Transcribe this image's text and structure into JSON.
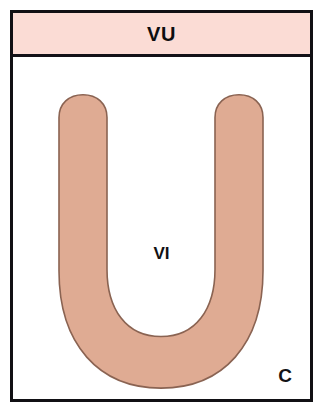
{
  "figure": {
    "panel_letter": "C",
    "frame_color": "#111014",
    "background_color": "#ffffff"
  },
  "header_band": {
    "label": "VU",
    "fill_color": "#fbdcd5",
    "border_color": "#131117"
  },
  "structure": {
    "name": "u-shaped-structure",
    "fill_color": "#dfab93",
    "outline_color": "#8a6352",
    "interior_label": "VI",
    "interior_fill_color": "#ffffff"
  }
}
